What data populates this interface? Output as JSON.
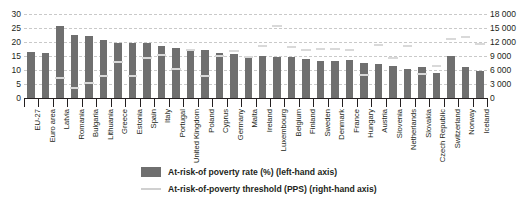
{
  "chart_data": {
    "type": "bar",
    "title": "",
    "subtitle": "",
    "xlabel": "",
    "ylabel": "",
    "y2label": "",
    "grid": true,
    "legend_position": "bottom-center",
    "ylim": [
      0,
      30
    ],
    "yticks": [
      0,
      5,
      10,
      15,
      20,
      25,
      30
    ],
    "y2lim": [
      0,
      18000
    ],
    "y2ticks": [
      0,
      3000,
      6000,
      9000,
      12000,
      15000,
      18000
    ],
    "categories": [
      "EU-27",
      "Euro area",
      "Latvia",
      "Romania",
      "Bulgaria",
      "Lithuania",
      "Greece",
      "Estonia",
      "Spain",
      "Italy",
      "Portugal",
      "United Kingdom",
      "Poland",
      "Cyprus",
      "Germany",
      "Malta",
      "Ireland",
      "Luxembourg",
      "Belgium",
      "Finland",
      "Sweden",
      "Denmark",
      "France",
      "Hungary",
      "Austria",
      "Slovenia",
      "Netherlands",
      "Slovakia",
      "Czech Republic",
      "Switzerland",
      "Norway",
      "Iceland"
    ],
    "series": [
      {
        "name": "At-risk-of poverty rate (%) (left-hand axis)",
        "axis": "left",
        "unit": "%",
        "color": "#6f6f6f",
        "values": [
          16.4,
          16.0,
          25.7,
          22.4,
          22.0,
          20.6,
          19.7,
          19.7,
          19.5,
          18.4,
          17.9,
          17.3,
          17.1,
          16.2,
          15.6,
          15.1,
          15.0,
          14.5,
          14.6,
          13.8,
          13.3,
          13.3,
          13.5,
          12.4,
          12.1,
          11.3,
          10.3,
          11.0,
          9.0,
          15.0,
          11.2,
          9.8
        ]
      },
      {
        "name": "At-risk-of-poverty threshold (PPS) (right-hand axis)",
        "axis": "right",
        "unit": "PPS",
        "color": "#d9d9d9",
        "values": [
          null,
          null,
          4100,
          1900,
          3100,
          4400,
          7500,
          4500,
          8300,
          9000,
          6100,
          10100,
          4400,
          8800,
          9900,
          8600,
          10900,
          15200,
          10800,
          10100,
          10300,
          10200,
          10100,
          4700,
          11200,
          8400,
          10900,
          5000,
          6600,
          12400,
          12900,
          11400
        ]
      }
    ]
  },
  "legend": {
    "items": [
      {
        "label": "At-risk-of poverty rate (%) (left-hand axis)",
        "marker": "bar-swatch"
      },
      {
        "label": "At-risk-of-poverty threshold (PPS) (right-hand axis)",
        "marker": "line-swatch"
      }
    ]
  }
}
